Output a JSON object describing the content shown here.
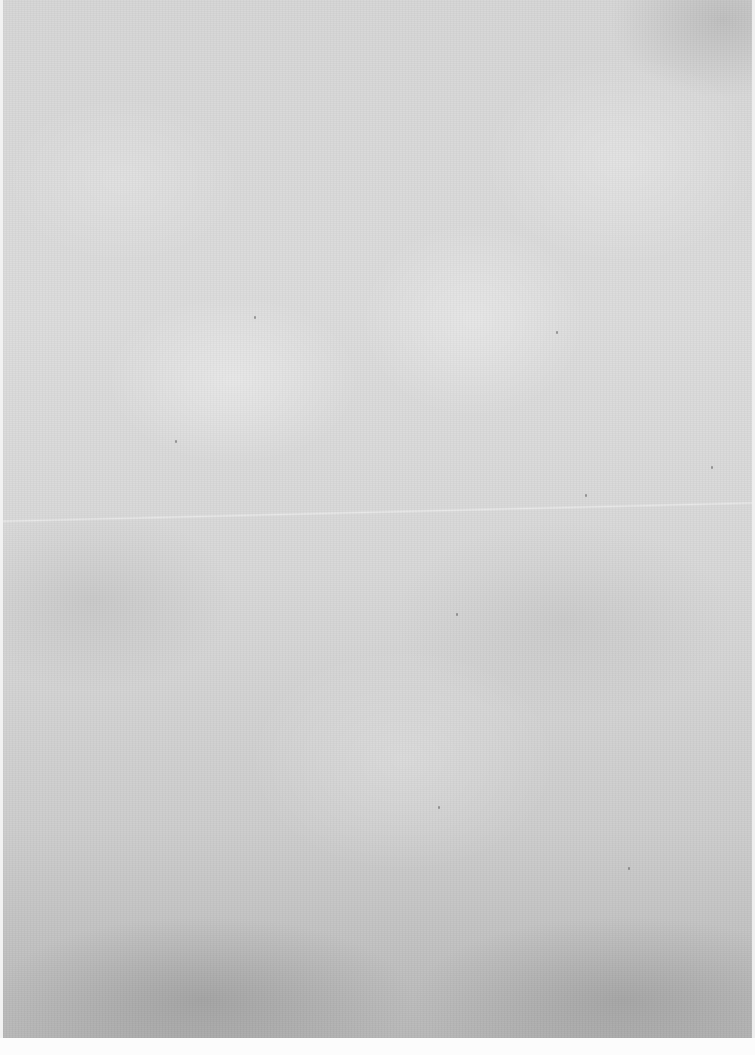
{
  "background": {
    "type": "textured-paper",
    "base_color": "#d6d6d6",
    "bottom_shade_color": "#b8b8b8",
    "edge_color": "#f2f2f2",
    "bottom_strip_color": "#fcfcfc"
  },
  "specks": [
    {
      "x": 585,
      "y": 494
    },
    {
      "x": 456,
      "y": 613
    },
    {
      "x": 711,
      "y": 466
    },
    {
      "x": 254,
      "y": 316
    },
    {
      "x": 556,
      "y": 331
    },
    {
      "x": 628,
      "y": 867
    },
    {
      "x": 438,
      "y": 806
    },
    {
      "x": 175,
      "y": 440
    }
  ]
}
